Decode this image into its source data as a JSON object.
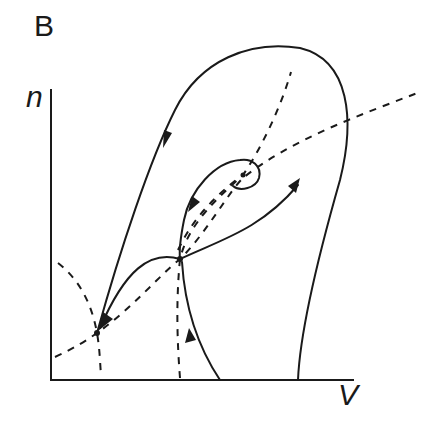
{
  "figure": {
    "panel_label": "B",
    "type": "phase-plane diagram",
    "x_axis_label": "V",
    "y_axis_label": "n",
    "colors": {
      "ink": "#1a1a1a",
      "background": "#ffffff"
    },
    "fixed_points": [
      {
        "name": "stable node",
        "x": 97,
        "y": 333
      },
      {
        "name": "saddle",
        "x": 180,
        "y": 259
      },
      {
        "name": "unstable focus",
        "x": 243,
        "y": 175
      }
    ],
    "curves": {
      "solid_trajectories": [
        "large loop from upper right down to stable node",
        "saddle unstable manifold toward stable node",
        "saddle unstable manifold toward upper right",
        "stable manifold from bottom into saddle",
        "orbit from focus into saddle"
      ],
      "dashed_nullclines": [
        "V-nullcline (n-shaped) through focus and saddle",
        "n-nullcline (sigmoidal) rising left to right"
      ]
    }
  }
}
